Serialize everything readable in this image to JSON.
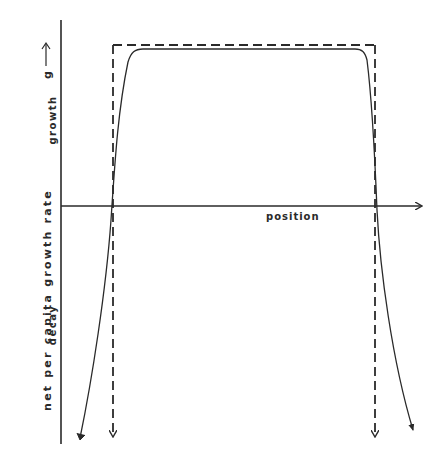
{
  "figure": {
    "type": "diagram",
    "y_axis_label": "net per capita growth rate",
    "y_axis_upper_label": "growth",
    "y_axis_lower_label": "decay",
    "y_axis_symbol": "g",
    "x_axis_label": "position",
    "colors": {
      "ink": "#2a2a2a",
      "background": "#ffffff"
    },
    "curves": [
      {
        "name": "idealized step (dashed)",
        "style": "dashed"
      },
      {
        "name": "smooth growth-rate profile (solid)",
        "style": "solid"
      }
    ]
  }
}
